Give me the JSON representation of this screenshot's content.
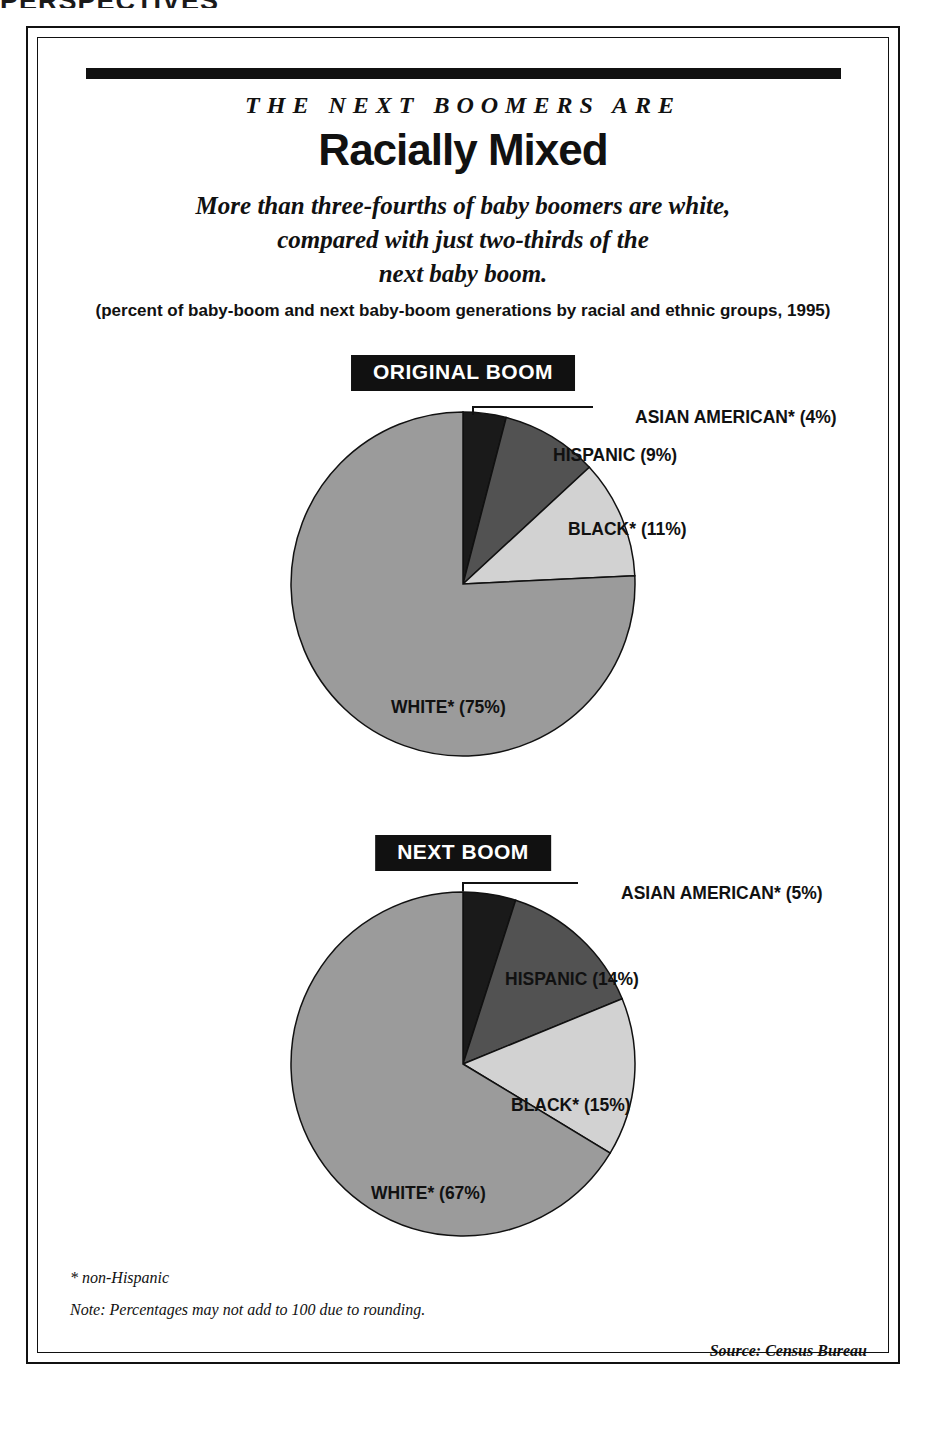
{
  "running_head": "PERSPECTIVES",
  "header": {
    "kicker": "THE NEXT BOOMERS ARE",
    "headline": "Racially Mixed",
    "deck_line1": "More than three-fourths of baby boomers are white,",
    "deck_line2": "compared with just two-thirds of the",
    "deck_line3": "next baby boom.",
    "subcaption": "(percent of baby-boom and next baby-boom generations by racial and ethnic groups, 1995)"
  },
  "footnotes": {
    "star": "* non-Hispanic",
    "note": "Note: Percentages may not add to 100 due to rounding.",
    "source": "Source: Census Bureau"
  },
  "colors": {
    "ink": "#111111",
    "asian": "#1a1a1a",
    "hispanic": "#525252",
    "black": "#d2d2d2",
    "white": "#9b9b9b",
    "page": "#ffffff"
  },
  "chart_data": [
    {
      "type": "pie",
      "title": "ORIGINAL BOOM",
      "categories": [
        "ASIAN AMERICAN*",
        "HISPANIC",
        "BLACK*",
        "WHITE*"
      ],
      "values": [
        4,
        9,
        11,
        75
      ],
      "labels": [
        "ASIAN AMERICAN* (4%)",
        "HISPANIC (9%)",
        "BLACK* (11%)",
        "WHITE* (75%)"
      ],
      "slice_colors": [
        "#1a1a1a",
        "#525252",
        "#d2d2d2",
        "#9b9b9b"
      ],
      "start_angle_deg": 0,
      "direction": "clockwise",
      "legend": "inline-labels",
      "xlabel": "",
      "ylabel": ""
    },
    {
      "type": "pie",
      "title": "NEXT BOOM",
      "categories": [
        "ASIAN AMERICAN*",
        "HISPANIC",
        "BLACK*",
        "WHITE*"
      ],
      "values": [
        5,
        14,
        15,
        67
      ],
      "labels": [
        "ASIAN AMERICAN* (5%)",
        "HISPANIC (14%)",
        "BLACK* (15%)",
        "WHITE* (67%)"
      ],
      "slice_colors": [
        "#1a1a1a",
        "#525252",
        "#d2d2d2",
        "#9b9b9b"
      ],
      "start_angle_deg": 0,
      "direction": "clockwise",
      "legend": "inline-labels",
      "xlabel": "",
      "ylabel": ""
    }
  ]
}
